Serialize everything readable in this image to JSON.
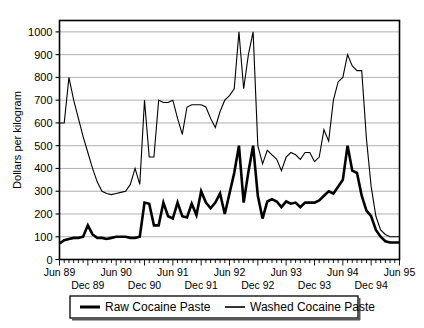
{
  "chart_data": {
    "type": "line",
    "title": "",
    "xlabel": "",
    "ylabel": "Dollars per kilogram",
    "ylim": [
      0,
      1050
    ],
    "yticks": [
      0,
      100,
      200,
      300,
      400,
      500,
      600,
      700,
      800,
      900,
      1000
    ],
    "ytick_labels": [
      "0",
      "100",
      "200",
      "300",
      "400",
      "500",
      "600",
      "700",
      "800",
      "900",
      "1000"
    ],
    "grid": true,
    "grid_axis": "y",
    "legend_position": "below",
    "x_start": "Jun 89",
    "x_end": "Jun 95",
    "x_interval": "monthly",
    "xtick_labels_upper": [
      "Jun 89",
      "Jun 90",
      "Jun 91",
      "Jun 92",
      "Jun 93",
      "Jun 94",
      "Jun 95"
    ],
    "xtick_labels_lower": [
      "Dec 89",
      "Dec 90",
      "Dec 91",
      "Dec 92",
      "Dec 93",
      "Dec 94"
    ],
    "x": [
      "Jun 89",
      "Jul 89",
      "Aug 89",
      "Sep 89",
      "Oct 89",
      "Nov 89",
      "Dec 89",
      "Jan 90",
      "Feb 90",
      "Mar 90",
      "Apr 90",
      "May 90",
      "Jun 90",
      "Jul 90",
      "Aug 90",
      "Sep 90",
      "Oct 90",
      "Nov 90",
      "Dec 90",
      "Jan 91",
      "Feb 91",
      "Mar 91",
      "Apr 91",
      "May 91",
      "Jun 91",
      "Jul 91",
      "Aug 91",
      "Sep 91",
      "Oct 91",
      "Nov 91",
      "Dec 91",
      "Jan 92",
      "Feb 92",
      "Mar 92",
      "Apr 92",
      "May 92",
      "Jun 92",
      "Jul 92",
      "Aug 92",
      "Sep 92",
      "Oct 92",
      "Nov 92",
      "Dec 92",
      "Jan 93",
      "Feb 93",
      "Mar 93",
      "Apr 93",
      "May 93",
      "Jun 93",
      "Jul 93",
      "Aug 93",
      "Sep 93",
      "Oct 93",
      "Nov 93",
      "Dec 93",
      "Jan 94",
      "Feb 94",
      "Mar 94",
      "Apr 94",
      "May 94",
      "Jun 94",
      "Jul 94",
      "Aug 94",
      "Sep 94",
      "Oct 94",
      "Nov 94",
      "Dec 94",
      "Jan 95",
      "Feb 95",
      "Mar 95",
      "Apr 95",
      "May 95",
      "Jun 95"
    ],
    "series": [
      {
        "name": "Raw Cocaine Paste",
        "line_width": 2.6,
        "color": "#000000",
        "values": [
          70,
          85,
          90,
          95,
          95,
          100,
          150,
          110,
          95,
          95,
          90,
          95,
          100,
          100,
          100,
          95,
          95,
          100,
          250,
          245,
          150,
          150,
          250,
          190,
          180,
          250,
          190,
          185,
          245,
          195,
          300,
          250,
          225,
          250,
          290,
          200,
          290,
          380,
          500,
          250,
          385,
          500,
          280,
          180,
          255,
          265,
          255,
          230,
          255,
          245,
          250,
          230,
          250,
          250,
          250,
          260,
          280,
          300,
          290,
          320,
          350,
          500,
          390,
          380,
          280,
          215,
          190,
          130,
          100,
          80,
          75,
          75,
          75
        ]
      },
      {
        "name": "Washed Cocaine Paste",
        "line_width": 1.1,
        "color": "#000000",
        "values": [
          600,
          600,
          800,
          700,
          620,
          540,
          470,
          400,
          340,
          300,
          290,
          285,
          290,
          295,
          300,
          330,
          400,
          330,
          700,
          450,
          450,
          700,
          690,
          690,
          700,
          620,
          550,
          670,
          680,
          680,
          680,
          670,
          620,
          580,
          650,
          700,
          720,
          750,
          1000,
          750,
          900,
          1000,
          500,
          420,
          480,
          460,
          440,
          390,
          450,
          470,
          460,
          440,
          470,
          470,
          430,
          450,
          570,
          520,
          700,
          780,
          800,
          900,
          850,
          830,
          830,
          530,
          320,
          190,
          130,
          110,
          100,
          100,
          100
        ]
      }
    ]
  },
  "legend": {
    "items": [
      {
        "label": "Raw Cocaine Paste"
      },
      {
        "label": "Washed Cocaine Paste"
      }
    ]
  }
}
